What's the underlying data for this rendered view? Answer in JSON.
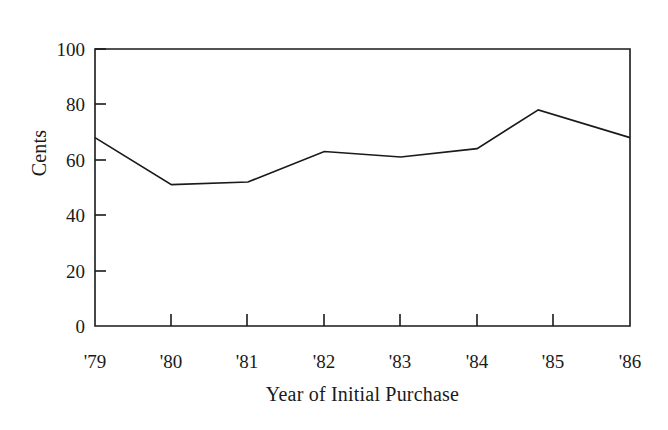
{
  "chart_data": {
    "type": "line",
    "title": "",
    "xlabel": "Year of Initial Purchase",
    "ylabel": "Cents",
    "x": [
      "'79",
      "'80",
      "'81",
      "'82",
      "'83",
      "'84",
      "'85",
      "'86"
    ],
    "categories": [
      "'79",
      "'80",
      "'81",
      "'82",
      "'83",
      "'84",
      "'85",
      "'86"
    ],
    "values": [
      68,
      51,
      52,
      63,
      61,
      64,
      78,
      68
    ],
    "series": [
      {
        "name": "Cents",
        "values": [
          68,
          51,
          52,
          63,
          61,
          64,
          78,
          68
        ]
      }
    ],
    "peak_note": "peak of 78 occurs slightly before the '85 tick",
    "vertices_value_at_x": [
      {
        "x": "'79",
        "y": 68
      },
      {
        "x": "'80",
        "y": 51
      },
      {
        "x": "'81",
        "y": 52
      },
      {
        "x": "'82",
        "y": 63
      },
      {
        "x": "'83",
        "y": 61
      },
      {
        "x": "'84",
        "y": 64
      },
      {
        "x": "'84.8",
        "y": 78
      },
      {
        "x": "'86",
        "y": 68
      }
    ],
    "ylim": [
      0,
      100
    ],
    "yticks": [
      0,
      20,
      40,
      60,
      80,
      100
    ],
    "ytick_labels": [
      "0",
      "20",
      "40",
      "60",
      "80",
      "100"
    ],
    "xtick_labels": [
      "'79",
      "'80",
      "'81",
      "'82",
      "'83",
      "'84",
      "'85",
      "'86"
    ],
    "grid": false,
    "legend": false,
    "legend_position": "none",
    "line_color": "#1a1a1a",
    "background_color": "#ffffff",
    "frame": "box-open-left"
  }
}
